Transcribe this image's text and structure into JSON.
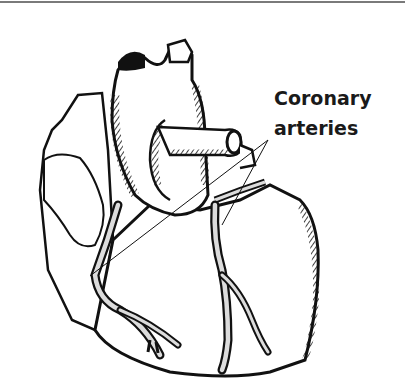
{
  "figure": {
    "label_lines": [
      "Coronary",
      "arteries"
    ],
    "colors": {
      "ink": "#111111",
      "artery_fill": "#dcdcdc",
      "background": "#ffffff",
      "rule": "#7a7a7a"
    }
  }
}
